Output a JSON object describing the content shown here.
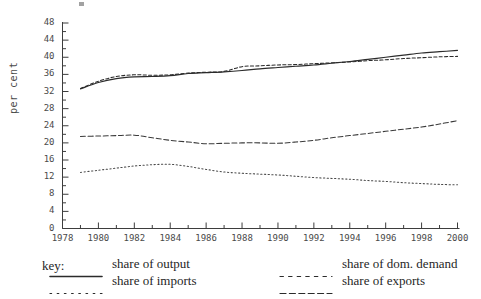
{
  "chart_data": {
    "type": "line",
    "title": "",
    "xlabel": "",
    "ylabel": "per cent",
    "xlim": [
      1978,
      2000
    ],
    "ylim": [
      0,
      48
    ],
    "ytick_step": 4,
    "yminor_step": 2,
    "xtick_step": 2,
    "xminor_step": 1,
    "grid": false,
    "legend_position": "below",
    "ytick_labels": [
      "0",
      "4",
      "8",
      "12",
      "16",
      "20",
      "24",
      "28",
      "32",
      "36",
      "40",
      "44",
      "48"
    ],
    "xtick_labels": [
      "1978",
      "1980",
      "1982",
      "1984",
      "1986",
      "1988",
      "1990",
      "1992",
      "1994",
      "1996",
      "1998",
      "2000"
    ],
    "x": [
      1979,
      1980,
      1981,
      1982,
      1983,
      1984,
      1985,
      1986,
      1987,
      1988,
      1989,
      1990,
      1991,
      1992,
      1993,
      1994,
      1995,
      1996,
      1997,
      1998,
      1999,
      2000
    ],
    "series": [
      {
        "name": "share of output",
        "style": "solid",
        "color": "#2b2b2b",
        "values": [
          32.6,
          34.1,
          35.0,
          35.4,
          35.5,
          35.7,
          36.2,
          36.4,
          36.6,
          36.9,
          37.3,
          37.6,
          37.9,
          38.2,
          38.6,
          39.0,
          39.5,
          40.0,
          40.5,
          41.0,
          41.3,
          41.6
        ]
      },
      {
        "name": "share of dom. demand",
        "style": "dashed",
        "color": "#2b2b2b",
        "values": [
          32.7,
          34.4,
          35.5,
          35.9,
          35.8,
          35.9,
          36.3,
          36.5,
          36.7,
          37.8,
          38.0,
          38.2,
          38.3,
          38.5,
          38.7,
          38.9,
          39.2,
          39.4,
          39.7,
          39.9,
          40.1,
          40.2
        ]
      },
      {
        "name": "share of exports",
        "style": "dashed-long",
        "color": "#3a3a3a",
        "values": [
          21.5,
          21.6,
          21.7,
          21.8,
          21.2,
          20.6,
          20.2,
          19.8,
          19.9,
          20.0,
          20.0,
          19.9,
          20.2,
          20.6,
          21.2,
          21.7,
          22.2,
          22.7,
          23.2,
          23.7,
          24.4,
          25.2
        ]
      },
      {
        "name": "share of imports",
        "style": "dotted",
        "color": "#4a4a4a",
        "values": [
          13.1,
          13.6,
          14.1,
          14.6,
          14.9,
          15.0,
          14.5,
          13.8,
          13.2,
          12.9,
          12.7,
          12.5,
          12.2,
          11.9,
          11.7,
          11.5,
          11.2,
          11.0,
          10.7,
          10.5,
          10.3,
          10.2
        ]
      }
    ]
  },
  "legend": {
    "key_label": "key:",
    "items": [
      {
        "label": "share of output",
        "style": "solid"
      },
      {
        "label": "share of imports",
        "style": "dotted"
      },
      {
        "label": "share of dom. demand",
        "style": "dashed"
      },
      {
        "label": "share of exports",
        "style": "dashed-long"
      }
    ]
  }
}
